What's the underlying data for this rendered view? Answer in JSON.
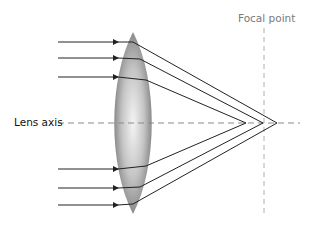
{
  "diagram": {
    "type": "convex-lens-spherical-aberration",
    "labels": {
      "focal_point": "Focal point",
      "lens_axis": "Lens axis"
    },
    "rays": [
      {
        "y_in": 42,
        "y_lens": 44,
        "converge_x": 277
      },
      {
        "y_in": 58,
        "y_lens": 60,
        "converge_x": 263
      },
      {
        "y_in": 77,
        "y_lens": 80,
        "converge_x": 246
      },
      {
        "y_in": 169,
        "y_lens": 166,
        "converge_x": 246
      },
      {
        "y_in": 188,
        "y_lens": 186,
        "converge_x": 263
      },
      {
        "y_in": 205,
        "y_lens": 204,
        "converge_x": 277
      }
    ],
    "colors": {
      "ray": "#222222",
      "lens_edge": "#8f8f8f",
      "lens_center": "#f2f2f2",
      "axis": "#8a8a8a",
      "focal_line": "#b0b0b0"
    }
  }
}
